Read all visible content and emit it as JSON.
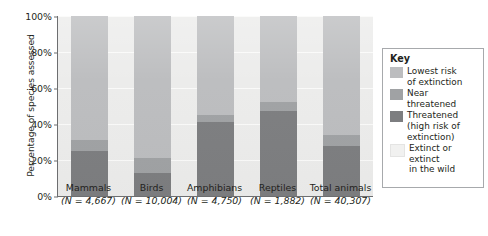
{
  "chart_data": {
    "type": "bar",
    "subtype": "stacked-bar-100",
    "title": "",
    "xlabel": "",
    "ylabel": "Percentage of species assessed",
    "ylim": [
      0,
      100
    ],
    "ytick_labels": [
      "0%",
      "20%",
      "40%",
      "60%",
      "80%",
      "100%"
    ],
    "ytick_values": [
      0,
      20,
      40,
      60,
      80,
      100
    ],
    "grid": true,
    "legend_position": "right",
    "categories": [
      "Mammals",
      "Birds",
      "Amphibians",
      "Reptiles",
      "Total animals"
    ],
    "category_sublabels": [
      "(N = 4,667)",
      "(N = 10,004)",
      "(N = 4,750)",
      "(N = 1,882)",
      "(N = 40,307)"
    ],
    "sample_sizes": [
      4667,
      10004,
      4750,
      1882,
      40307
    ],
    "series": [
      {
        "name": "Threatened (high risk of extinction)",
        "color": "#7d7e80",
        "values": [
          25,
          13,
          41,
          47,
          28
        ]
      },
      {
        "name": "Near threatened",
        "color": "#a0a2a4",
        "values": [
          6,
          8,
          4,
          5,
          6
        ]
      },
      {
        "name": "Lowest risk of extinction",
        "color": "#bcbdbf",
        "values": [
          69,
          79,
          55,
          48,
          66
        ]
      },
      {
        "name": "Extinct or extinct in the wild",
        "color": "#ececeb",
        "values": [
          0,
          0,
          0,
          0,
          0
        ]
      }
    ]
  },
  "legend": {
    "title": "Key",
    "entries": [
      {
        "label": "Lowest risk of extinction",
        "line1": "Lowest risk",
        "line2": "of extinction",
        "color": "#bcbdbf"
      },
      {
        "label": "Near threatened",
        "line1": "Near",
        "line2": "threatened",
        "color": "#a0a2a4"
      },
      {
        "label": "Threatened (high risk of extinction)",
        "line1": "Threatened",
        "line2": "(high risk of",
        "line3": "extinction)",
        "color": "#7d7e80"
      },
      {
        "label": "Extinct or extinct in the wild",
        "line1": "Extinct or",
        "line2": "extinct",
        "line3": "in the wild",
        "color": "#f1f1f0"
      }
    ]
  }
}
